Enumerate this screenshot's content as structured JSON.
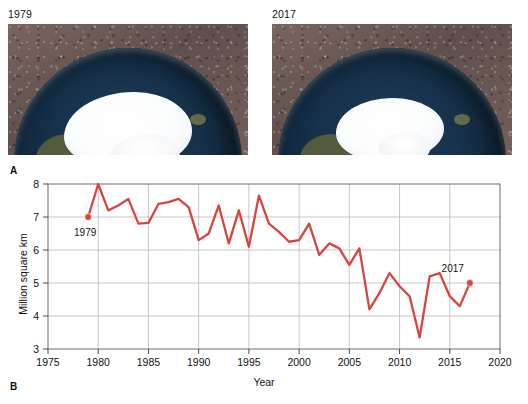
{
  "panel_a": {
    "letter": "A",
    "images": [
      {
        "year_label": "1979",
        "name": "arctic-sea-ice-1979",
        "ice_extent_note": "extensive ice cap"
      },
      {
        "year_label": "2017",
        "name": "arctic-sea-ice-2017",
        "ice_extent_note": "reduced ice cap"
      }
    ]
  },
  "panel_b": {
    "letter": "B"
  },
  "chart_data": {
    "type": "line",
    "title": "",
    "xlabel": "Year",
    "ylabel": "Million square km",
    "xlim": [
      1975,
      2020
    ],
    "ylim": [
      3,
      8
    ],
    "xticks": [
      1975,
      1980,
      1985,
      1990,
      1995,
      2000,
      2005,
      2010,
      2015,
      2020
    ],
    "yticks": [
      3,
      4,
      5,
      6,
      7,
      8
    ],
    "grid": true,
    "legend": "none",
    "line_color": "#d8453f",
    "marker_color": "#d8453f",
    "x": [
      1979,
      1980,
      1981,
      1982,
      1983,
      1984,
      1985,
      1986,
      1987,
      1988,
      1989,
      1990,
      1991,
      1992,
      1993,
      1994,
      1995,
      1996,
      1997,
      1998,
      1999,
      2000,
      2001,
      2002,
      2003,
      2004,
      2005,
      2006,
      2007,
      2008,
      2009,
      2010,
      2011,
      2012,
      2013,
      2014,
      2015,
      2016,
      2017
    ],
    "values": [
      7.0,
      8.0,
      7.2,
      7.35,
      7.55,
      6.8,
      6.82,
      7.4,
      7.45,
      7.55,
      7.3,
      6.3,
      6.5,
      7.35,
      6.2,
      7.2,
      6.1,
      7.65,
      6.8,
      6.55,
      6.25,
      6.3,
      6.8,
      5.85,
      6.2,
      6.05,
      5.55,
      6.05,
      4.2,
      4.7,
      5.3,
      4.9,
      4.6,
      3.35,
      5.2,
      5.3,
      4.6,
      4.3,
      5.0
    ],
    "annotations": [
      {
        "label": "1979",
        "x": 1979,
        "y": 7.0,
        "marker": true
      },
      {
        "label": "2017",
        "x": 2017,
        "y": 5.0,
        "marker": true
      }
    ]
  }
}
